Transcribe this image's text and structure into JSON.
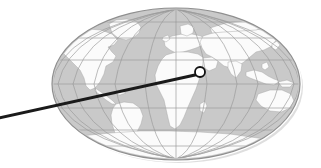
{
  "figure": {
    "type": "world-map-locator",
    "canvas": {
      "width": 321,
      "height": 168
    },
    "background_color": "#ffffff"
  },
  "globe": {
    "projection": "oval (Mollweide / Robinson style)",
    "center": {
      "x": 176,
      "y": 84
    },
    "radius_x": 124,
    "radius_y": 76,
    "ocean_color": "#c9c9c9",
    "land_color": "#fbfbfb",
    "outline_color": "#8f8f8f",
    "halo_color": "#ffffff",
    "shadow_color": "#d8d8d8",
    "graticule": {
      "visible": true,
      "color": "#9a9a9a",
      "parallel_count": 7,
      "meridian_count": 13,
      "parallel_labels": [
        "75N",
        "60N",
        "30N",
        "0",
        "30S",
        "60S",
        "75S"
      ],
      "meridian_spacing_deg": 30
    },
    "landmasses": [
      "North America",
      "Greenland",
      "South America",
      "Europe",
      "Africa",
      "Asia",
      "Indonesia",
      "Australia",
      "Antarctica"
    ]
  },
  "marker": {
    "shape": "circle",
    "center": {
      "x": 200,
      "y": 72
    },
    "radius": 5,
    "fill_color": "#ffffff",
    "stroke_color": "#111111",
    "stroke_width": 1.8,
    "region": "East Africa / Arabian Peninsula"
  },
  "leader_line": {
    "color": "#1a1a1a",
    "width": 3,
    "from": {
      "x": -6,
      "y": 119
    },
    "to": {
      "x": 195,
      "y": 75
    },
    "description": "callout line running off the left edge of the frame"
  }
}
